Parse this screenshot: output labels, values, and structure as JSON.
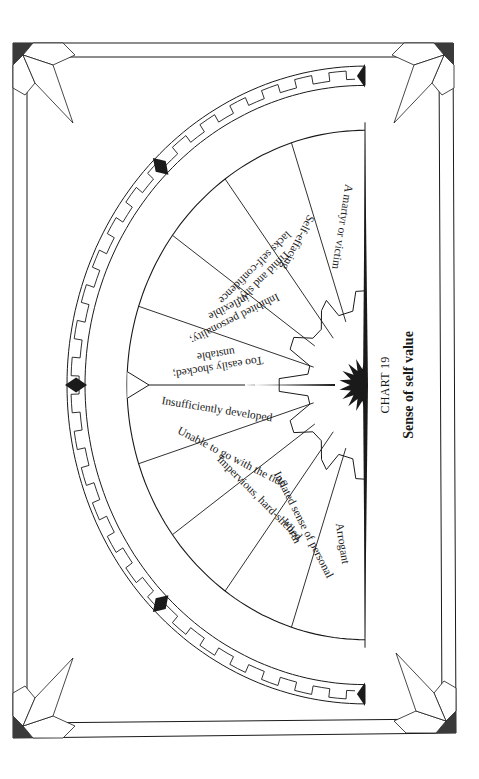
{
  "page": {
    "chart_number": "CHART 19",
    "chart_title": "Sense of self value",
    "orientation": "rotated-90-clockwise"
  },
  "colors": {
    "ink": "#1a1a1a",
    "paper": "#ffffff",
    "corner_fill": "#3a3a3a"
  },
  "chart_data": {
    "type": "pie",
    "subtype": "semicircle-fan-dial",
    "title": "Sense of self value",
    "subtitle": "CHART 19",
    "segment_count": 10,
    "segments": [
      {
        "index": 0,
        "lines": [
          "A martyr or victim"
        ]
      },
      {
        "index": 1,
        "lines": [
          "Self-effacing"
        ]
      },
      {
        "index": 2,
        "lines": [
          "Timid and shy;",
          "lacks self-confidence"
        ]
      },
      {
        "index": 3,
        "lines": [
          "Inhibited personality;",
          "inflexible"
        ]
      },
      {
        "index": 4,
        "lines": [
          "Too easily shocked;",
          "unstable"
        ]
      },
      {
        "index": 5,
        "lines": [
          "Insufficiently developed"
        ]
      },
      {
        "index": 6,
        "lines": [
          "Unable to go with the tide"
        ]
      },
      {
        "index": 7,
        "lines": [
          "Impervious, hard-shelled"
        ]
      },
      {
        "index": 8,
        "lines": [
          "Inflated sense of personal",
          "worth"
        ]
      },
      {
        "index": 9,
        "lines": [
          "Arrogant"
        ]
      }
    ],
    "center_marker": "starburst-pointer",
    "pointer_direction": "between segments 4 and 5",
    "border": "greek-key band with 5 diamond markers",
    "values": [
      1,
      1,
      1,
      1,
      1,
      1,
      1,
      1,
      1,
      1
    ],
    "categories": [
      "A martyr or victim",
      "Self-effacing",
      "Timid and shy; lacks self-confidence",
      "Inhibited personality; inflexible",
      "Too easily shocked; unstable",
      "Insufficiently developed",
      "Unable to go with the tide",
      "Impervious, hard-shelled",
      "Inflated sense of personal worth",
      "Arrogant"
    ]
  }
}
